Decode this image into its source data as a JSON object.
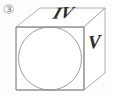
{
  "figure": {
    "marker": "③",
    "marker_name": "circled-number-three",
    "alt_title": "Cube in oblique projection with inscribed circle on front face",
    "labels": {
      "top_face": "IV",
      "right_face": "V"
    },
    "colors": {
      "background": "#fdfdfd",
      "outline": "#9a9a9a",
      "outline_dark": "#7d7d7d",
      "circle": "#8e8e94",
      "label_text": "#2b2b2b",
      "marker_text": "#8c8c8c"
    },
    "geometry": {
      "projection": "oblique",
      "front_face": [
        [
          16,
          27
        ],
        [
          84,
          27
        ],
        [
          84,
          90
        ],
        [
          16,
          90
        ]
      ],
      "top_face": [
        [
          16,
          27
        ],
        [
          40,
          8
        ],
        [
          105,
          8
        ],
        [
          84,
          27
        ]
      ],
      "right_face": [
        [
          84,
          27
        ],
        [
          105,
          8
        ],
        [
          105,
          73
        ],
        [
          84,
          90
        ]
      ],
      "inscribed_circle": {
        "cx": 50,
        "cy": 58.5,
        "r": 31.5
      },
      "stroke_width": 0.8
    }
  }
}
